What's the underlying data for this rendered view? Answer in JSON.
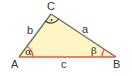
{
  "diagram": {
    "type": "right-triangle",
    "fill_color": "#fdf5c4",
    "edge_color": "#6b6b6b",
    "highlight_color": "#e8563a",
    "vertices": {
      "A": {
        "label": "A",
        "x": 19,
        "y": 57
      },
      "B": {
        "label": "B",
        "x": 116,
        "y": 57
      },
      "C": {
        "label": "C",
        "x": 51,
        "y": 14
      }
    },
    "sides": {
      "a": {
        "label": "a",
        "between": "B-C"
      },
      "b": {
        "label": "b",
        "between": "A-C"
      },
      "c": {
        "label": "c",
        "between": "A-B",
        "highlighted": true
      }
    },
    "angles": {
      "alpha": {
        "label": "α",
        "at": "A"
      },
      "beta": {
        "label": "β",
        "at": "B"
      },
      "gamma": {
        "label": "·",
        "at": "C",
        "right_angle": true
      }
    }
  }
}
